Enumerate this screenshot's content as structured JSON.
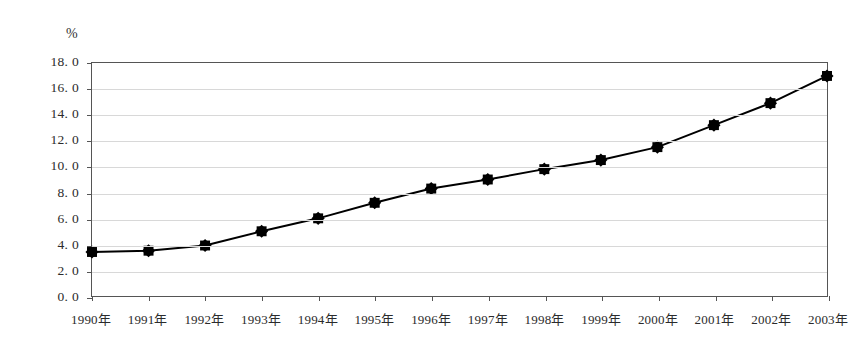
{
  "chart_data": {
    "type": "line",
    "title": "",
    "subtitle": "",
    "xlabel": "",
    "ylabel": "",
    "unit_label": "%",
    "categories": [
      "1990年",
      "1991年",
      "1992年",
      "1993年",
      "1994年",
      "1995年",
      "1996年",
      "1997年",
      "1998年",
      "1999年",
      "2000年",
      "2001年",
      "2002年",
      "2003年"
    ],
    "values": [
      3.4,
      3.5,
      3.9,
      5.0,
      6.0,
      7.2,
      8.3,
      9.0,
      9.8,
      10.5,
      11.5,
      13.2,
      14.9,
      17.0
    ],
    "series": [
      {
        "name": "",
        "values": [
          3.4,
          3.5,
          3.9,
          5.0,
          6.0,
          7.2,
          8.3,
          9.0,
          9.8,
          10.5,
          11.5,
          13.2,
          14.9,
          17.0
        ]
      }
    ],
    "ylim": [
      0.0,
      18.0
    ],
    "ytick_values": [
      18.0,
      16.0,
      14.0,
      12.0,
      10.0,
      8.0,
      6.0,
      4.0,
      2.0,
      0.0
    ],
    "ytick_labels": [
      "18. 0",
      "16. 0",
      "14. 0",
      "12. 0",
      "10. 0",
      "8. 0",
      "6. 0",
      "4. 0",
      "2. 0",
      "0. 0"
    ],
    "grid": true,
    "grid_color": "#d8d8d8",
    "legend": false,
    "legend_position": "none",
    "line_color": "#000000",
    "marker": "filled-square",
    "marker_color": "#000000",
    "border_color": "#555555",
    "background_color": "#ffffff",
    "annotations": []
  }
}
